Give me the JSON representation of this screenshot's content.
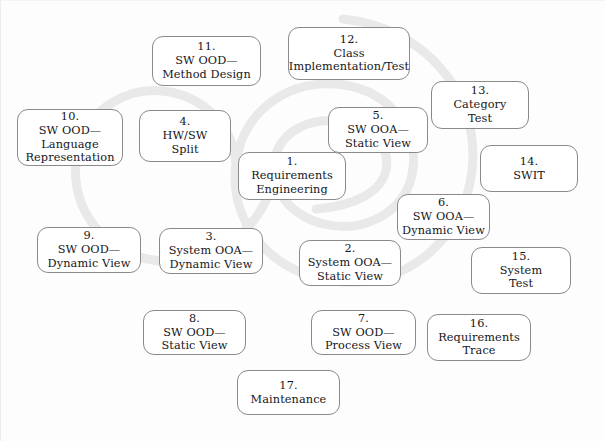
{
  "diagram": {
    "background_color": "#fdfdfd",
    "spiral_color": "#e9e9e9",
    "node_border_color": "#8a8a8a",
    "node_fill_color": "#ffffff",
    "text_color": "#15161a",
    "nodes": [
      {
        "id": "node-1",
        "number": "1.",
        "lines": [
          "Requirements",
          "Engineering"
        ],
        "x": 238,
        "y": 152,
        "w": 108,
        "h": 48
      },
      {
        "id": "node-2",
        "number": "2.",
        "lines": [
          "System OOA—",
          "Static View"
        ],
        "x": 299,
        "y": 240,
        "w": 102,
        "h": 46
      },
      {
        "id": "node-3",
        "number": "3.",
        "lines": [
          "System OOA—",
          "Dynamic View"
        ],
        "x": 159,
        "y": 228,
        "w": 104,
        "h": 46
      },
      {
        "id": "node-4",
        "number": "4.",
        "lines": [
          "HW/SW",
          "Split"
        ],
        "x": 139,
        "y": 110,
        "w": 92,
        "h": 52
      },
      {
        "id": "node-5",
        "number": "5.",
        "lines": [
          "SW OOA—",
          "Static View"
        ],
        "x": 328,
        "y": 107,
        "w": 100,
        "h": 46
      },
      {
        "id": "node-6",
        "number": "6.",
        "lines": [
          "SW OOA—",
          "Dynamic View"
        ],
        "x": 397,
        "y": 194,
        "w": 93,
        "h": 46
      },
      {
        "id": "node-7",
        "number": "7.",
        "lines": [
          "SW OOD—",
          "Process View"
        ],
        "x": 311,
        "y": 310,
        "w": 105,
        "h": 45
      },
      {
        "id": "node-8",
        "number": "8.",
        "lines": [
          "SW OOD—",
          "Static View"
        ],
        "x": 143,
        "y": 310,
        "w": 103,
        "h": 45
      },
      {
        "id": "node-9",
        "number": "9.",
        "lines": [
          "SW OOD—",
          "Dynamic View"
        ],
        "x": 37,
        "y": 227,
        "w": 104,
        "h": 46
      },
      {
        "id": "node-10",
        "number": "10.",
        "lines": [
          "SW OOD—",
          "Language",
          "Representation"
        ],
        "x": 17,
        "y": 109,
        "w": 106,
        "h": 57
      },
      {
        "id": "node-11",
        "number": "11.",
        "lines": [
          "SW OOD—",
          "Method Design"
        ],
        "x": 152,
        "y": 36,
        "w": 109,
        "h": 50
      },
      {
        "id": "node-12",
        "number": "12.",
        "lines": [
          "Class",
          "Implementation/Test"
        ],
        "x": 288,
        "y": 27,
        "w": 122,
        "h": 53
      },
      {
        "id": "node-13",
        "number": "13.",
        "lines": [
          "Category",
          "Test"
        ],
        "x": 431,
        "y": 81,
        "w": 98,
        "h": 48
      },
      {
        "id": "node-14",
        "number": "14.",
        "lines": [
          "SWIT"
        ],
        "x": 480,
        "y": 145,
        "w": 98,
        "h": 47
      },
      {
        "id": "node-15",
        "number": "15.",
        "lines": [
          "System",
          "Test"
        ],
        "x": 471,
        "y": 247,
        "w": 100,
        "h": 47
      },
      {
        "id": "node-16",
        "number": "16.",
        "lines": [
          "Requirements",
          "Trace"
        ],
        "x": 427,
        "y": 314,
        "w": 104,
        "h": 47
      },
      {
        "id": "node-17",
        "number": "17.",
        "lines": [
          "Maintenance"
        ],
        "x": 237,
        "y": 370,
        "w": 103,
        "h": 45
      }
    ],
    "spiral_paths": [
      "M 316 209 C 356 206 382 191 386 170 C 391 146 371 127 344 122 C 311 116 281 131 275 158 C 268 189 291 216 324 224 C 364 234 404 212 412 175 C 421 131 390 92 344 85 C 290 77 243 110 236 163 C 228 224 272 273 333 281 C 404 291 464 240 472 171 C 481 92 423 27 343 19",
      "M 236 163 C 233 127 206 99 170 92 C 128 84 88 109 78 150 C 66 199 97 248 147 259 C 205 272 262 234 274 177"
    ]
  }
}
